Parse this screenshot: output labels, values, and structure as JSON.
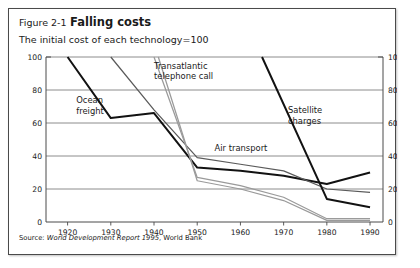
{
  "figure": {
    "number": "Figure 2-1",
    "title": "Falling costs",
    "subtitle": "The initial cost of each technology=100",
    "source_prefix": "Source: ",
    "source_italic": "World Development Report 1995",
    "source_suffix": ", World Bank"
  },
  "chart_data": {
    "type": "line",
    "title": "Figure 2-1 Falling costs",
    "subtitle": "The initial cost of each technology=100",
    "xlabel": "",
    "ylabel": "",
    "xlim": [
      1915,
      1993
    ],
    "ylim": [
      0,
      100
    ],
    "xticks": [
      "1920",
      "1930",
      "1940",
      "1950",
      "1960",
      "1970",
      "1980",
      "1990"
    ],
    "yticks": [
      "0",
      "20",
      "40",
      "60",
      "80",
      "100"
    ],
    "yticks_right": [
      "0",
      "20",
      "40",
      "60",
      "80",
      "100"
    ],
    "grid": "horizontal",
    "legend": "inline-annotations",
    "series": [
      {
        "name": "Ocean freight",
        "color": "#121212",
        "weight": "thick",
        "label_x": 1922,
        "label_y": 72,
        "x": [
          1920,
          1930,
          1940,
          1950,
          1960,
          1970,
          1980,
          1990
        ],
        "y": [
          100,
          63,
          66,
          33,
          31,
          28,
          23,
          30
        ]
      },
      {
        "name": "Air transport",
        "color": "#5a5a5a",
        "weight": "thin",
        "label_x": 1954,
        "label_y": 43,
        "x": [
          1930,
          1940,
          1950,
          1960,
          1970,
          1980,
          1990
        ],
        "y": [
          100,
          68,
          39,
          35,
          31,
          20,
          18
        ]
      },
      {
        "name": "Transatlantic telephone call",
        "color": "#9a9a9a",
        "weight": "thin",
        "label_x": 1940,
        "label_y": 93,
        "x": [
          1940,
          1950,
          1960,
          1970,
          1980,
          1990
        ],
        "y": [
          100,
          27,
          22,
          15,
          2,
          2
        ]
      },
      {
        "name": "Transatlantic telephone call (lower)",
        "color": "#9a9a9a",
        "weight": "thin",
        "label_x": null,
        "label_y": null,
        "x": [
          1941,
          1950,
          1960,
          1970,
          1980,
          1990
        ],
        "y": [
          100,
          25,
          20,
          13,
          1,
          1
        ]
      },
      {
        "name": "Satellite charges",
        "color": "#121212",
        "weight": "thick",
        "label_x": 1971,
        "label_y": 66,
        "x": [
          1965,
          1980,
          1990
        ],
        "y": [
          100,
          14,
          9
        ]
      }
    ]
  }
}
